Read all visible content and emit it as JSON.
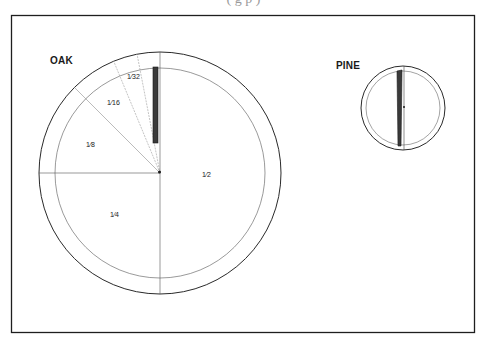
{
  "caption": {
    "partial_text": "( g p )"
  },
  "diagram": {
    "panels": [
      {
        "id": "oak",
        "title": "OAK",
        "sectors": [
          {
            "label": "1/2",
            "display": "1⁄2"
          },
          {
            "label": "1/4",
            "display": "1⁄4"
          },
          {
            "label": "1/8",
            "display": "1⁄8"
          },
          {
            "label": "1/16",
            "display": "1⁄16"
          },
          {
            "label": "1/32",
            "display": "1⁄32"
          }
        ]
      },
      {
        "id": "pine",
        "title": "PINE",
        "sectors": []
      }
    ],
    "colors": {
      "line": "#2a2a2a",
      "thin_line": "#6a6a6a",
      "core_fill": "#3a3a3a",
      "frame": "#1e1e1e"
    }
  }
}
